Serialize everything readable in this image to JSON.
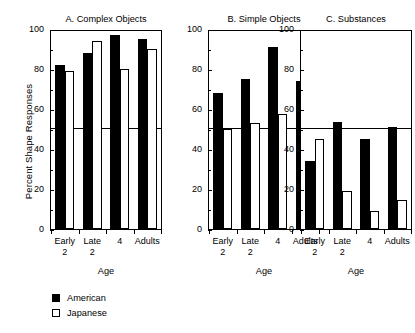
{
  "figure": {
    "y_axis_label": "Percent Shape Responses",
    "x_axis_title": "Age",
    "reference_line_value": 50
  },
  "legend": {
    "items": [
      {
        "label": "American",
        "marker": "filled-square",
        "color": "#000000"
      },
      {
        "label": "Japanese",
        "marker": "open-square",
        "color": "#ffffff"
      }
    ]
  },
  "chart_data": [
    {
      "type": "bar",
      "title": "A. Complex Objects",
      "xlabel": "Age",
      "ylabel": "Percent Shape Responses",
      "ylim": [
        0,
        100
      ],
      "yticks": [
        0,
        20,
        40,
        60,
        80,
        100
      ],
      "grid": false,
      "reference_line": 50,
      "legend_position": "below-figure",
      "categories": [
        "Early 2",
        "Late 2",
        "4",
        "Adults"
      ],
      "series": [
        {
          "name": "American",
          "values": [
            82,
            88,
            97,
            95
          ]
        },
        {
          "name": "Japanese",
          "values": [
            79,
            94,
            80,
            90
          ]
        }
      ]
    },
    {
      "type": "bar",
      "title": "B. Simple Objects",
      "xlabel": "Age",
      "ylabel": "Percent Shape Responses",
      "ylim": [
        0,
        100
      ],
      "yticks": [
        0,
        20,
        40,
        60,
        80,
        100
      ],
      "grid": false,
      "reference_line": 50,
      "legend_position": "below-figure",
      "categories": [
        "Early 2",
        "Late 2",
        "4",
        "Adults"
      ],
      "series": [
        {
          "name": "American",
          "values": [
            68,
            75,
            91,
            74
          ]
        },
        {
          "name": "Japanese",
          "values": [
            50,
            53,
            57.5,
            35.5
          ]
        }
      ]
    },
    {
      "type": "bar",
      "title": "C. Substances",
      "xlabel": "Age",
      "ylabel": "Percent Shape Responses",
      "ylim": [
        0,
        100
      ],
      "yticks": [
        0,
        20,
        40,
        60,
        80,
        100
      ],
      "grid": false,
      "reference_line": 50,
      "legend_position": "below-figure",
      "categories": [
        "Early 2",
        "Late 2",
        "4",
        "Adults"
      ],
      "series": [
        {
          "name": "American",
          "values": [
            34,
            53.5,
            45,
            51
          ]
        },
        {
          "name": "Japanese",
          "values": [
            45,
            19,
            9,
            14.5
          ]
        }
      ]
    }
  ],
  "panels": [
    {
      "title": "A. Complex Objects",
      "axis_title": "Age",
      "ytick_labels": [
        "0",
        "20",
        "40",
        "60",
        "80",
        "100"
      ],
      "xtick_labels": [
        [
          "Early",
          "2"
        ],
        [
          "Late",
          "2"
        ],
        [
          "4",
          ""
        ],
        [
          "Adults",
          ""
        ]
      ]
    },
    {
      "title": "B. Simple Objects",
      "axis_title": "Age",
      "ytick_labels": [
        "0",
        "20",
        "40",
        "60",
        "80",
        "100"
      ],
      "xtick_labels": [
        [
          "Early",
          "2"
        ],
        [
          "Late",
          "2"
        ],
        [
          "4",
          ""
        ],
        [
          "Adults",
          ""
        ]
      ]
    },
    {
      "title": "C. Substances",
      "axis_title": "Age",
      "ytick_labels": [
        "0",
        "20",
        "40",
        "60",
        "80",
        "100"
      ],
      "xtick_labels": [
        [
          "Early",
          "2"
        ],
        [
          "Late",
          "2"
        ],
        [
          "4",
          ""
        ],
        [
          "Adults",
          ""
        ]
      ]
    }
  ]
}
